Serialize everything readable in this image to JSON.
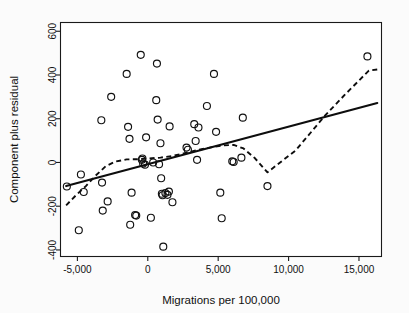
{
  "figure": {
    "background_color": "#fbfbfb",
    "plot_background_color": "#ffffff",
    "frame_color": "#1a1a1a",
    "marker_color": "#111111",
    "line_color": "#0d0d0d"
  },
  "chart_data": {
    "type": "scatter",
    "title": "",
    "subtitle": "",
    "xlabel": "Migrations per 100,000",
    "ylabel": "Component plus residual",
    "xlim": [
      -6200,
      16600
    ],
    "ylim": [
      -430,
      640
    ],
    "grid": false,
    "legend": null,
    "xticks": [
      -5000,
      0,
      5000,
      10000,
      15000
    ],
    "xtick_labels": [
      "-5,000",
      "0",
      "5,000",
      "10,000",
      "15,000"
    ],
    "yticks": [
      -400,
      -200,
      0,
      200,
      400,
      600
    ],
    "ytick_labels": [
      "-400",
      "-200",
      "0",
      "200",
      "400",
      "600"
    ],
    "points": [
      [
        -5750,
        -110
      ],
      [
        -4900,
        -310
      ],
      [
        -4750,
        -55
      ],
      [
        -4550,
        -135
      ],
      [
        -3300,
        193
      ],
      [
        -3250,
        -92
      ],
      [
        -3200,
        -220
      ],
      [
        -2850,
        -178
      ],
      [
        -2600,
        300
      ],
      [
        -1500,
        405
      ],
      [
        -1400,
        163
      ],
      [
        -1300,
        108
      ],
      [
        -1250,
        -285
      ],
      [
        -1150,
        -138
      ],
      [
        -900,
        -240
      ],
      [
        -820,
        -243
      ],
      [
        -500,
        492
      ],
      [
        -420,
        12
      ],
      [
        -380,
        18
      ],
      [
        -330,
        -5
      ],
      [
        -200,
        -10
      ],
      [
        -120,
        115
      ],
      [
        220,
        -253
      ],
      [
        380,
        0
      ],
      [
        600,
        285
      ],
      [
        650,
        452
      ],
      [
        700,
        196
      ],
      [
        800,
        -8
      ],
      [
        900,
        88
      ],
      [
        950,
        -72
      ],
      [
        1000,
        -143
      ],
      [
        1050,
        -150
      ],
      [
        1100,
        -385
      ],
      [
        1250,
        -140
      ],
      [
        1400,
        -148
      ],
      [
        1500,
        -133
      ],
      [
        1550,
        165
      ],
      [
        1750,
        -182
      ],
      [
        2750,
        68
      ],
      [
        2850,
        58
      ],
      [
        3300,
        175
      ],
      [
        3400,
        98
      ],
      [
        3500,
        12
      ],
      [
        3600,
        160
      ],
      [
        4200,
        258
      ],
      [
        4700,
        405
      ],
      [
        4850,
        140
      ],
      [
        5150,
        -138
      ],
      [
        5250,
        -255
      ],
      [
        6000,
        5
      ],
      [
        6100,
        2
      ],
      [
        6650,
        22
      ],
      [
        6750,
        205
      ],
      [
        8500,
        -108
      ],
      [
        15600,
        485
      ]
    ],
    "series": [
      {
        "name": "linear-fit",
        "type": "line",
        "style": "solid",
        "points": [
          [
            -5800,
            -108
          ],
          [
            16300,
            272
          ]
        ]
      },
      {
        "name": "lowess-smooth",
        "type": "line",
        "style": "dashed",
        "points": [
          [
            -5800,
            -196
          ],
          [
            -5100,
            -150
          ],
          [
            -4400,
            -108
          ],
          [
            -3700,
            -60
          ],
          [
            -3000,
            -18
          ],
          [
            -2300,
            4
          ],
          [
            -1500,
            14
          ],
          [
            -700,
            15
          ],
          [
            0,
            18
          ],
          [
            900,
            22
          ],
          [
            1800,
            30
          ],
          [
            2700,
            44
          ],
          [
            3500,
            56
          ],
          [
            4400,
            68
          ],
          [
            5300,
            78
          ],
          [
            6100,
            80
          ],
          [
            6800,
            64
          ],
          [
            7600,
            20
          ],
          [
            8500,
            -45
          ],
          [
            10500,
            55
          ],
          [
            12600,
            215
          ],
          [
            14000,
            310
          ],
          [
            15700,
            420
          ],
          [
            16300,
            425
          ]
        ]
      }
    ]
  }
}
